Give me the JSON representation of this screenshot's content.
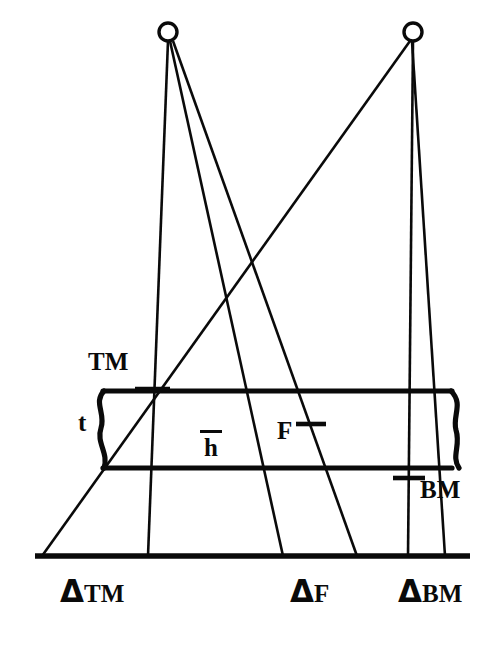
{
  "figure": {
    "background_color": "#ffffff",
    "ink_color": "#0a0a0a"
  },
  "labels": {
    "top_mark": "TM",
    "bottom_mark": "BM",
    "fringe": "F",
    "thickness": "t",
    "h_bar_char": "h",
    "delta_symbol": "Δ"
  },
  "axis_labels": [
    {
      "name": "delta-tm",
      "delta": "Δ",
      "sub": "TM"
    },
    {
      "name": "delta-f",
      "delta": "Δ",
      "sub": "F"
    },
    {
      "name": "delta-bm",
      "delta": "Δ",
      "sub": "BM"
    }
  ],
  "geometry": {
    "sources": [
      {
        "name": "left-source",
        "cx": 168,
        "cy": 32,
        "r": 9
      },
      {
        "name": "right-source",
        "cx": 413,
        "cy": 32,
        "r": 9
      }
    ],
    "slab": {
      "top_y": 391,
      "bottom_y": 468,
      "left_x": 103,
      "right_x": 452
    },
    "baseline": {
      "x1": 35,
      "x2": 470,
      "y": 556
    },
    "marks": [
      {
        "name": "tm-tick",
        "x": 152,
        "y": 389
      },
      {
        "name": "f-tick",
        "x": 310,
        "y": 424
      },
      {
        "name": "bm-tick",
        "x": 409,
        "y": 478
      }
    ],
    "rays": [
      {
        "name": "ray-left-vertical",
        "from": [
          168,
          41
        ],
        "to": [
          148,
          556
        ]
      },
      {
        "name": "ray-left-to-f",
        "from": [
          170,
          41
        ],
        "to": [
          283,
          556
        ]
      },
      {
        "name": "ray-left-to-bm",
        "from": [
          172,
          41
        ],
        "to": [
          357,
          556
        ]
      },
      {
        "name": "ray-right-vertical",
        "from": [
          413,
          41
        ],
        "to": [
          408,
          556
        ]
      },
      {
        "name": "ray-right-to-tm",
        "from": [
          410,
          41
        ],
        "to": [
          42,
          556
        ]
      },
      {
        "name": "ray-right-to-bm-out",
        "from": [
          412,
          41
        ],
        "to": [
          445,
          556
        ]
      }
    ]
  }
}
